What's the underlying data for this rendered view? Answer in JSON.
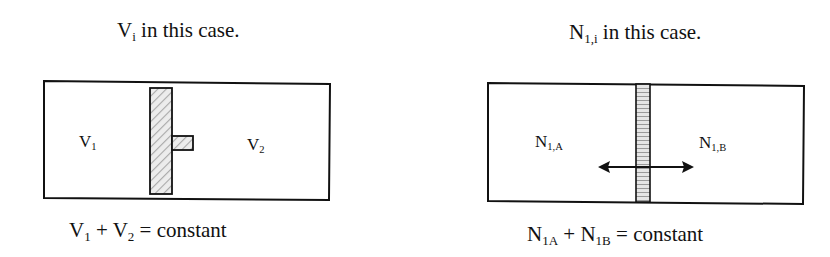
{
  "left_panel": {
    "title_main": "V",
    "title_sub": "i",
    "title_rest": " in this case.",
    "label_left_main": "V",
    "label_left_sub": "1",
    "label_right_main": "V",
    "label_right_sub": "2",
    "equation": {
      "a_main": "V",
      "a_sub": "1",
      "op": " + ",
      "b_main": "V",
      "b_sub": "2",
      "rest": " = constant"
    },
    "separator": "movable piston (hatched)"
  },
  "right_panel": {
    "title_main": "N",
    "title_sub": "1,i",
    "title_rest": " in this case.",
    "label_left_main": "N",
    "label_left_sub": "1,A",
    "label_right_main": "N",
    "label_right_sub": "1,B",
    "equation": {
      "a_main": "N",
      "a_sub": "1A",
      "op": " + ",
      "b_main": "N",
      "b_sub": "1B",
      "rest": " = constant"
    },
    "separator": "permeable membrane with double-headed arrow"
  },
  "colors": {
    "stroke": "#111111",
    "hatch_fill": "#d9d9d9",
    "background": "#ffffff"
  }
}
